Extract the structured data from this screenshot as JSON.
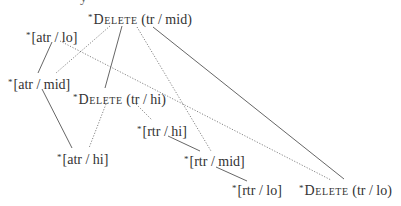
{
  "diagram": {
    "type": "constraint-ranking-lattice",
    "line_color": "#555555",
    "text_color": "#333333",
    "fragment_top": "y",
    "nodes": [
      {
        "id": "del_tr_mid",
        "star": "*",
        "head": "Delete",
        "arg": "(tr / mid)",
        "x": 88,
        "y": 10,
        "smallcaps": true
      },
      {
        "id": "atr_lo",
        "star": "*",
        "head": "",
        "arg": "[atr / lo]",
        "x": 26,
        "y": 28,
        "smallcaps": false
      },
      {
        "id": "atr_mid",
        "star": "*",
        "head": "",
        "arg": "[atr / mid]",
        "x": 8,
        "y": 75,
        "smallcaps": false
      },
      {
        "id": "del_tr_hi",
        "star": "*",
        "head": "Delete",
        "arg": "(tr / hi)",
        "x": 73,
        "y": 90,
        "smallcaps": true
      },
      {
        "id": "rtr_hi",
        "star": "*",
        "head": "",
        "arg": "[rtr / hi]",
        "x": 137,
        "y": 122,
        "smallcaps": false
      },
      {
        "id": "atr_hi",
        "star": "*",
        "head": "",
        "arg": "[atr / hi]",
        "x": 57,
        "y": 150,
        "smallcaps": false
      },
      {
        "id": "rtr_mid",
        "star": "*",
        "head": "",
        "arg": "[rtr / mid]",
        "x": 184,
        "y": 152,
        "smallcaps": false
      },
      {
        "id": "rtr_lo",
        "star": "*",
        "head": "",
        "arg": "[rtr / lo]",
        "x": 232,
        "y": 181,
        "smallcaps": false
      },
      {
        "id": "del_tr_lo",
        "star": "*",
        "head": "Delete",
        "arg": "(tr / lo)",
        "x": 299,
        "y": 181,
        "smallcaps": true
      }
    ],
    "edges": [
      {
        "from": "atr_lo",
        "to": "atr_mid",
        "style": "solid",
        "x1": 52,
        "y1": 42,
        "x2": 38,
        "y2": 73
      },
      {
        "from": "del_tr_mid",
        "to": "atr_mid",
        "style": "dotted",
        "x1": 110,
        "y1": 26,
        "x2": 56,
        "y2": 73
      },
      {
        "from": "del_tr_mid",
        "to": "del_tr_hi",
        "style": "solid",
        "x1": 122,
        "y1": 26,
        "x2": 105,
        "y2": 88
      },
      {
        "from": "del_tr_mid",
        "to": "rtr_mid",
        "style": "dotted",
        "x1": 137,
        "y1": 27,
        "x2": 211,
        "y2": 151
      },
      {
        "from": "del_tr_mid",
        "to": "del_tr_lo",
        "style": "solid",
        "x1": 153,
        "y1": 27,
        "x2": 344,
        "y2": 179
      },
      {
        "from": "atr_lo",
        "to": "del_tr_lo",
        "style": "dotted",
        "x1": 60,
        "y1": 41,
        "x2": 331,
        "y2": 180
      },
      {
        "from": "atr_mid",
        "to": "atr_hi",
        "style": "solid",
        "x1": 42,
        "y1": 89,
        "x2": 72,
        "y2": 148
      },
      {
        "from": "del_tr_hi",
        "to": "atr_hi",
        "style": "dotted",
        "x1": 106,
        "y1": 104,
        "x2": 89,
        "y2": 148
      },
      {
        "from": "del_tr_hi",
        "to": "rtr_hi",
        "style": "dotted",
        "x1": 136,
        "y1": 104,
        "x2": 152,
        "y2": 120
      },
      {
        "from": "rtr_hi",
        "to": "rtr_mid",
        "style": "solid",
        "x1": 168,
        "y1": 136,
        "x2": 200,
        "y2": 151
      },
      {
        "from": "rtr_mid",
        "to": "rtr_lo",
        "style": "solid",
        "x1": 216,
        "y1": 167,
        "x2": 247,
        "y2": 181
      }
    ]
  }
}
